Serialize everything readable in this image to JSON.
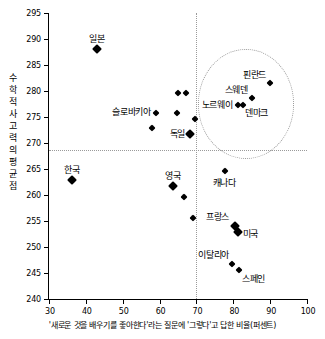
{
  "chart_data": {
    "type": "scatter",
    "title": "",
    "xlabel": "'새로운 것을 배우기를 좋아한다'라는 질문에 '그렇다'고 답한 비율(퍼센트)",
    "ylabel_lines": [
      "수",
      "학",
      "적",
      "사",
      "고",
      "력",
      "의",
      "평",
      "균",
      "점"
    ],
    "ylabel": "수학적 사고력의 평균점",
    "xlim": [
      30,
      100
    ],
    "ylim": [
      240,
      295
    ],
    "xticks": [
      30,
      40,
      50,
      60,
      70,
      80,
      90,
      100
    ],
    "yticks": [
      240,
      245,
      250,
      255,
      260,
      265,
      270,
      275,
      280,
      285,
      290,
      295
    ],
    "grid": false,
    "legend": "none",
    "reference_lines": {
      "horizontal_y": 268.7,
      "vertical_x": 70
    },
    "highlight_region": {
      "shape": "circle",
      "center_x": 83.5,
      "center_y": 277.5,
      "radius_x": 13,
      "radius_y": 10.5,
      "style": "dotted"
    },
    "marker_shape": "diamond",
    "marker_color": "#000000",
    "points": [
      {
        "label": "일본",
        "x": 43.0,
        "y": 288.0,
        "marker_size": 7,
        "label_dx": 0,
        "label_dy": -10,
        "label_align": "center"
      },
      {
        "label": "한국",
        "x": 36.2,
        "y": 262.9,
        "marker_size": 7,
        "label_dx": 0,
        "label_dy": -10,
        "label_align": "center"
      },
      {
        "label": "슬로바키아",
        "x": 59.0,
        "y": 275.7,
        "marker_size": 5,
        "label_dx": -5,
        "label_dy": -1,
        "label_align": "right"
      },
      {
        "label": "독일",
        "x": 68.3,
        "y": 271.8,
        "marker_size": 7,
        "label_dx": -5,
        "label_dy": 0,
        "label_align": "right"
      },
      {
        "label": "영국",
        "x": 63.6,
        "y": 261.8,
        "marker_size": 7,
        "label_dx": 0,
        "label_dy": -10,
        "label_align": "center"
      },
      {
        "label": "핀란드",
        "x": 90.0,
        "y": 281.5,
        "marker_size": 5,
        "label_dx": -4,
        "label_dy": -8,
        "label_align": "right"
      },
      {
        "label": "스웨덴",
        "x": 85.0,
        "y": 278.6,
        "marker_size": 5,
        "label_dx": -4,
        "label_dy": -8,
        "label_align": "right"
      },
      {
        "label": "노르웨이",
        "x": 81.4,
        "y": 277.4,
        "marker_size": 5,
        "label_dx": -6,
        "label_dy": 0,
        "label_align": "right"
      },
      {
        "label": "덴마크",
        "x": 82.6,
        "y": 277.4,
        "marker_size": 5,
        "label_dx": 2,
        "label_dy": 8,
        "label_align": "left"
      },
      {
        "label": "캐나다",
        "x": 77.8,
        "y": 264.6,
        "marker_size": 5,
        "label_dx": -1,
        "label_dy": 12,
        "label_align": "center"
      },
      {
        "label": "프랑스",
        "x": 80.5,
        "y": 254.0,
        "marker_size": 7,
        "label_dx": -6,
        "label_dy": -9,
        "label_align": "right"
      },
      {
        "label": "미국",
        "x": 81.2,
        "y": 252.9,
        "marker_size": 7,
        "label_dx": 5,
        "label_dy": 2,
        "label_align": "left"
      },
      {
        "label": "이탈리아",
        "x": 79.7,
        "y": 246.8,
        "marker_size": 5,
        "label_dx": -3,
        "label_dy": -9,
        "label_align": "right"
      },
      {
        "label": "스페인",
        "x": 81.5,
        "y": 245.5,
        "marker_size": 5,
        "label_dx": 3,
        "label_dy": 9,
        "label_align": "left"
      },
      {
        "label": "",
        "x": 65.0,
        "y": 279.6,
        "marker_size": 5,
        "label_dx": 0,
        "label_dy": 0,
        "label_align": "center"
      },
      {
        "label": "",
        "x": 67.2,
        "y": 279.6,
        "marker_size": 5,
        "label_dx": 0,
        "label_dy": 0,
        "label_align": "center"
      },
      {
        "label": "",
        "x": 64.8,
        "y": 275.7,
        "marker_size": 5,
        "label_dx": 0,
        "label_dy": 0,
        "label_align": "center"
      },
      {
        "label": "",
        "x": 69.5,
        "y": 274.6,
        "marker_size": 5,
        "label_dx": 0,
        "label_dy": 0,
        "label_align": "center"
      },
      {
        "label": "",
        "x": 58.0,
        "y": 272.8,
        "marker_size": 5,
        "label_dx": 0,
        "label_dy": 0,
        "label_align": "center"
      },
      {
        "label": "",
        "x": 68.0,
        "y": 271.8,
        "marker_size": 5,
        "label_dx": 0,
        "label_dy": 0,
        "label_align": "center"
      },
      {
        "label": "",
        "x": 66.5,
        "y": 259.6,
        "marker_size": 5,
        "label_dx": 0,
        "label_dy": 0,
        "label_align": "center"
      },
      {
        "label": "",
        "x": 69.0,
        "y": 255.6,
        "marker_size": 5,
        "label_dx": 0,
        "label_dy": 0,
        "label_align": "center"
      }
    ]
  }
}
